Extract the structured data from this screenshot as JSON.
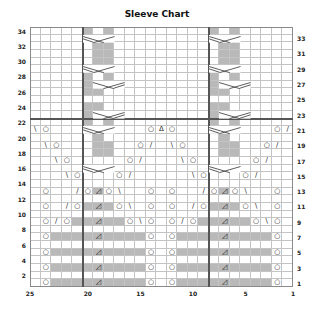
{
  "title": "Sleeve Chart",
  "grid": {
    "columns": 25,
    "rows": 34,
    "column_numbering": "right-to-left",
    "colors": {
      "shade": "#b9b9b9",
      "gridline": "#c4c4c4",
      "boldline": "#555555"
    },
    "bold_vertical_lines_after_col": [
      21,
      9
    ],
    "bold_horizontal_line_after_row": 22
  },
  "left_row_labels": [
    "2",
    "4",
    "6",
    "8",
    "10",
    "12",
    "14",
    "16",
    "18",
    "20",
    "22",
    "24",
    "26",
    "28",
    "30",
    "32",
    "34"
  ],
  "right_row_labels": [
    "1",
    "3",
    "5",
    "7",
    "9",
    "11",
    "13",
    "15",
    "17",
    "19",
    "21",
    "23",
    "25",
    "27",
    "29",
    "31",
    "33"
  ],
  "column_labels": [
    {
      "col": 25,
      "text": "25"
    },
    {
      "col": 20,
      "text": "20"
    },
    {
      "col": 15,
      "text": "15"
    },
    {
      "col": 10,
      "text": "10"
    },
    {
      "col": 5,
      "text": "5"
    },
    {
      "col": 1,
      "text": "1"
    }
  ],
  "legend_symbols": {
    "O": "yarn over",
    "/": "k2tog",
    "\\": "ssk",
    "Δ": "central double decrease",
    "◿": "shaded decrease",
    "X": "cable crossing"
  },
  "shaded_cells": [
    {
      "row": 1,
      "cols": [
        23,
        22,
        21,
        20,
        19,
        18,
        17,
        16,
        15,
        11,
        10,
        9,
        8,
        7,
        6,
        5,
        4,
        3
      ]
    },
    {
      "row": 3,
      "cols": [
        23,
        22,
        21,
        20,
        19,
        18,
        17,
        16,
        15,
        11,
        10,
        9,
        8,
        7,
        6,
        5,
        4,
        3
      ]
    },
    {
      "row": 5,
      "cols": [
        23,
        22,
        21,
        20,
        19,
        18,
        17,
        16,
        15,
        11,
        10,
        9,
        8,
        7,
        6,
        5,
        4,
        3
      ]
    },
    {
      "row": 7,
      "cols": [
        23,
        22,
        21,
        20,
        19,
        18,
        17,
        16,
        15,
        11,
        10,
        9,
        8,
        7,
        6,
        5,
        4,
        3
      ]
    },
    {
      "row": 9,
      "cols": [
        21,
        20,
        19,
        18,
        17,
        9,
        8,
        7,
        6,
        5
      ]
    },
    {
      "row": 11,
      "cols": [
        20,
        19,
        18,
        8,
        7,
        6
      ]
    },
    {
      "row": 13,
      "cols": [
        19,
        7
      ]
    },
    {
      "row": 18,
      "cols": [
        19,
        18,
        7,
        6
      ]
    },
    {
      "row": 19,
      "cols": [
        19,
        18,
        7,
        6
      ]
    },
    {
      "row": 20,
      "cols": [
        19,
        7
      ]
    },
    {
      "row": 22,
      "cols": [
        20,
        18,
        8,
        6
      ]
    },
    {
      "row": 23,
      "cols": [
        20,
        18,
        8,
        6
      ]
    },
    {
      "row": 24,
      "cols": [
        20,
        19,
        8,
        7
      ]
    },
    {
      "row": 26,
      "cols": [
        20,
        19,
        8,
        7
      ]
    },
    {
      "row": 27,
      "cols": [
        20,
        8
      ]
    },
    {
      "row": 28,
      "cols": [
        20,
        18,
        8,
        6
      ]
    },
    {
      "row": 30,
      "cols": [
        19,
        18,
        7,
        6
      ]
    },
    {
      "row": 31,
      "cols": [
        19,
        18,
        7,
        6
      ]
    },
    {
      "row": 32,
      "cols": [
        19,
        18,
        7,
        6
      ]
    },
    {
      "row": 33,
      "cols": [
        20,
        18,
        8,
        6
      ]
    },
    {
      "row": 34,
      "cols": [
        20,
        18,
        8,
        6
      ]
    }
  ],
  "symbols": [
    {
      "row": 1,
      "col": 24,
      "s": "O"
    },
    {
      "row": 1,
      "col": 19,
      "s": "◿"
    },
    {
      "row": 1,
      "col": 14,
      "s": "O"
    },
    {
      "row": 1,
      "col": 12,
      "s": "O"
    },
    {
      "row": 1,
      "col": 7,
      "s": "◿"
    },
    {
      "row": 1,
      "col": 2,
      "s": "O"
    },
    {
      "row": 3,
      "col": 24,
      "s": "O"
    },
    {
      "row": 3,
      "col": 19,
      "s": "◿"
    },
    {
      "row": 3,
      "col": 14,
      "s": "O"
    },
    {
      "row": 3,
      "col": 12,
      "s": "O"
    },
    {
      "row": 3,
      "col": 7,
      "s": "◿"
    },
    {
      "row": 3,
      "col": 2,
      "s": "O"
    },
    {
      "row": 5,
      "col": 24,
      "s": "O"
    },
    {
      "row": 5,
      "col": 19,
      "s": "◿"
    },
    {
      "row": 5,
      "col": 14,
      "s": "O"
    },
    {
      "row": 5,
      "col": 12,
      "s": "O"
    },
    {
      "row": 5,
      "col": 7,
      "s": "◿"
    },
    {
      "row": 5,
      "col": 2,
      "s": "O"
    },
    {
      "row": 7,
      "col": 24,
      "s": "O"
    },
    {
      "row": 7,
      "col": 19,
      "s": "◿"
    },
    {
      "row": 7,
      "col": 14,
      "s": "O"
    },
    {
      "row": 7,
      "col": 12,
      "s": "O"
    },
    {
      "row": 7,
      "col": 7,
      "s": "◿"
    },
    {
      "row": 7,
      "col": 2,
      "s": "O"
    },
    {
      "row": 9,
      "col": 24,
      "s": "O"
    },
    {
      "row": 9,
      "col": 23,
      "s": "/"
    },
    {
      "row": 9,
      "col": 22,
      "s": "O"
    },
    {
      "row": 9,
      "col": 19,
      "s": "◿"
    },
    {
      "row": 9,
      "col": 16,
      "s": "O"
    },
    {
      "row": 9,
      "col": 15,
      "s": "\\"
    },
    {
      "row": 9,
      "col": 14,
      "s": "O"
    },
    {
      "row": 9,
      "col": 12,
      "s": "O"
    },
    {
      "row": 9,
      "col": 11,
      "s": "/"
    },
    {
      "row": 9,
      "col": 10,
      "s": "O"
    },
    {
      "row": 9,
      "col": 7,
      "s": "◿"
    },
    {
      "row": 9,
      "col": 4,
      "s": "O"
    },
    {
      "row": 9,
      "col": 3,
      "s": "\\"
    },
    {
      "row": 9,
      "col": 2,
      "s": "O"
    },
    {
      "row": 11,
      "col": 24,
      "s": "O"
    },
    {
      "row": 11,
      "col": 22,
      "s": "/"
    },
    {
      "row": 11,
      "col": 21,
      "s": "O"
    },
    {
      "row": 11,
      "col": 19,
      "s": "◿"
    },
    {
      "row": 11,
      "col": 17,
      "s": "O"
    },
    {
      "row": 11,
      "col": 16,
      "s": "\\"
    },
    {
      "row": 11,
      "col": 14,
      "s": "O"
    },
    {
      "row": 11,
      "col": 12,
      "s": "O"
    },
    {
      "row": 11,
      "col": 10,
      "s": "/"
    },
    {
      "row": 11,
      "col": 9,
      "s": "O"
    },
    {
      "row": 11,
      "col": 7,
      "s": "◿"
    },
    {
      "row": 11,
      "col": 5,
      "s": "O"
    },
    {
      "row": 11,
      "col": 4,
      "s": "\\"
    },
    {
      "row": 11,
      "col": 2,
      "s": "O"
    },
    {
      "row": 13,
      "col": 24,
      "s": "O"
    },
    {
      "row": 13,
      "col": 21,
      "s": "/"
    },
    {
      "row": 13,
      "col": 20,
      "s": "O"
    },
    {
      "row": 13,
      "col": 19,
      "s": "◿"
    },
    {
      "row": 13,
      "col": 18,
      "s": "O"
    },
    {
      "row": 13,
      "col": 17,
      "s": "\\"
    },
    {
      "row": 13,
      "col": 14,
      "s": "O"
    },
    {
      "row": 13,
      "col": 12,
      "s": "O"
    },
    {
      "row": 13,
      "col": 9,
      "s": "/"
    },
    {
      "row": 13,
      "col": 8,
      "s": "O"
    },
    {
      "row": 13,
      "col": 7,
      "s": "◿"
    },
    {
      "row": 13,
      "col": 6,
      "s": "O"
    },
    {
      "row": 13,
      "col": 5,
      "s": "\\"
    },
    {
      "row": 13,
      "col": 2,
      "s": "O"
    },
    {
      "row": 15,
      "col": 22,
      "s": "\\"
    },
    {
      "row": 15,
      "col": 21,
      "s": "O"
    },
    {
      "row": 15,
      "col": 17,
      "s": "O"
    },
    {
      "row": 15,
      "col": 16,
      "s": "/"
    },
    {
      "row": 15,
      "col": 10,
      "s": "\\"
    },
    {
      "row": 15,
      "col": 9,
      "s": "O"
    },
    {
      "row": 15,
      "col": 5,
      "s": "O"
    },
    {
      "row": 15,
      "col": 4,
      "s": "/"
    },
    {
      "row": 17,
      "col": 23,
      "s": "\\"
    },
    {
      "row": 17,
      "col": 22,
      "s": "O"
    },
    {
      "row": 17,
      "col": 16,
      "s": "O"
    },
    {
      "row": 17,
      "col": 15,
      "s": "/"
    },
    {
      "row": 17,
      "col": 11,
      "s": "\\"
    },
    {
      "row": 17,
      "col": 10,
      "s": "O"
    },
    {
      "row": 17,
      "col": 4,
      "s": "O"
    },
    {
      "row": 17,
      "col": 3,
      "s": "/"
    },
    {
      "row": 19,
      "col": 24,
      "s": "\\"
    },
    {
      "row": 19,
      "col": 23,
      "s": "O"
    },
    {
      "row": 19,
      "col": 15,
      "s": "O"
    },
    {
      "row": 19,
      "col": 14,
      "s": "/"
    },
    {
      "row": 19,
      "col": 12,
      "s": "\\"
    },
    {
      "row": 19,
      "col": 11,
      "s": "O"
    },
    {
      "row": 19,
      "col": 3,
      "s": "O"
    },
    {
      "row": 19,
      "col": 2,
      "s": "/"
    },
    {
      "row": 21,
      "col": 25,
      "s": "\\"
    },
    {
      "row": 21,
      "col": 24,
      "s": "O"
    },
    {
      "row": 21,
      "col": 14,
      "s": "O"
    },
    {
      "row": 21,
      "col": 13,
      "s": "Δ"
    },
    {
      "row": 21,
      "col": 12,
      "s": "O"
    },
    {
      "row": 21,
      "col": 2,
      "s": "O"
    },
    {
      "row": 21,
      "col": 1,
      "s": "/"
    }
  ],
  "cables": [
    {
      "row": 16,
      "col_left": 20,
      "dir": "right"
    },
    {
      "row": 16,
      "col_left": 8,
      "dir": "right"
    },
    {
      "row": 21,
      "col_left": 20,
      "dir": "right"
    },
    {
      "row": 21,
      "col_left": 8,
      "dir": "right"
    },
    {
      "row": 23,
      "col_left": 19,
      "dir": "left"
    },
    {
      "row": 23,
      "col_left": 7,
      "dir": "left"
    },
    {
      "row": 27,
      "col_left": 19,
      "dir": "left"
    },
    {
      "row": 27,
      "col_left": 7,
      "dir": "left"
    },
    {
      "row": 29,
      "col_left": 20,
      "dir": "right"
    },
    {
      "row": 29,
      "col_left": 8,
      "dir": "right"
    },
    {
      "row": 33,
      "col_left": 20,
      "dir": "right"
    },
    {
      "row": 33,
      "col_left": 8,
      "dir": "right"
    }
  ]
}
